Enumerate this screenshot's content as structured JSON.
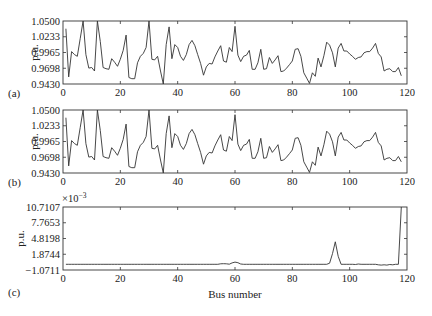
{
  "chart_data": [
    {
      "type": "line",
      "panel_label": "(a)",
      "ylabel": "p.u.",
      "xlabel": "",
      "xlim": [
        0,
        120
      ],
      "ylim": [
        0.943,
        1.05
      ],
      "xticks": [
        "0",
        "20",
        "40",
        "60",
        "80",
        "100",
        "120"
      ],
      "yticks": [
        "1.0500",
        "1.0233",
        "0.9965",
        "0.9698",
        "0.9430"
      ],
      "grid": false,
      "x": [
        1,
        2,
        3,
        4,
        5,
        6,
        7,
        8,
        9,
        10,
        11,
        12,
        13,
        14,
        15,
        16,
        17,
        18,
        19,
        20,
        21,
        22,
        23,
        24,
        25,
        26,
        27,
        28,
        29,
        30,
        31,
        32,
        33,
        34,
        35,
        36,
        37,
        38,
        39,
        40,
        41,
        42,
        43,
        44,
        45,
        46,
        47,
        48,
        49,
        50,
        51,
        52,
        53,
        54,
        55,
        56,
        57,
        58,
        59,
        60,
        61,
        62,
        63,
        64,
        65,
        66,
        67,
        68,
        69,
        70,
        71,
        72,
        73,
        74,
        75,
        76,
        77,
        78,
        79,
        80,
        81,
        82,
        83,
        84,
        85,
        86,
        87,
        88,
        89,
        90,
        91,
        92,
        93,
        94,
        95,
        96,
        97,
        98,
        99,
        100,
        101,
        102,
        103,
        104,
        105,
        106,
        107,
        108,
        109,
        110,
        111,
        112,
        113,
        114,
        115,
        116,
        117,
        118
      ],
      "series": [
        {
          "name": "Voltage magnitude (a)",
          "values": [
            1.037,
            0.955,
            0.998,
            0.993,
            0.99,
            1.02,
            1.05,
            0.993,
            0.97,
            0.971,
            0.965,
            1.05,
            1.015,
            0.971,
            0.969,
            0.968,
            0.986,
            0.98,
            0.973,
            0.985,
            1.0,
            1.026,
            0.954,
            0.952,
            0.952,
            0.979,
            0.99,
            0.995,
            1.005,
            1.05,
            0.985,
            0.984,
            0.99,
            0.965,
            0.943,
            1.01,
            1.04,
            0.986,
            1.01,
            1.005,
            0.99,
            0.983,
            0.993,
            1.01,
            1.017,
            1.008,
            0.993,
            0.978,
            0.958,
            0.972,
            0.978,
            0.977,
            0.989,
            0.999,
            1.008,
            0.982,
            0.98,
            1.005,
            0.998,
            1.041,
            0.992,
            0.981,
            0.99,
            0.992,
            1.0,
            0.968,
            0.968,
            0.979,
            1.002,
            0.968,
            0.969,
            0.988,
            0.978,
            0.984,
            0.991,
            0.964,
            0.965,
            0.97,
            0.976,
            0.982,
            1.002,
            1.003,
            0.99,
            0.962,
            0.953,
            0.944,
            0.962,
            0.956,
            0.987,
            0.972,
            0.991,
            1.014,
            1.009,
            0.996,
            0.972,
            1.004,
            1.012,
            0.999,
            0.999,
            0.994,
            0.99,
            0.985,
            0.988,
            0.989,
            0.996,
            0.998,
            0.998,
            1.004,
            1.012,
            0.995,
            0.989,
            0.965,
            0.968,
            0.969,
            0.964,
            0.964,
            0.971,
            0.957
          ]
        }
      ]
    },
    {
      "type": "line",
      "panel_label": "(b)",
      "ylabel": "p.u.",
      "xlabel": "",
      "xlim": [
        0,
        120
      ],
      "ylim": [
        0.943,
        1.05
      ],
      "xticks": [
        "0",
        "20",
        "40",
        "60",
        "80",
        "100",
        "120"
      ],
      "yticks": [
        "1.0500",
        "1.0233",
        "0.9965",
        "0.9698",
        "0.9430"
      ],
      "grid": false,
      "x": [
        1,
        2,
        3,
        4,
        5,
        6,
        7,
        8,
        9,
        10,
        11,
        12,
        13,
        14,
        15,
        16,
        17,
        18,
        19,
        20,
        21,
        22,
        23,
        24,
        25,
        26,
        27,
        28,
        29,
        30,
        31,
        32,
        33,
        34,
        35,
        36,
        37,
        38,
        39,
        40,
        41,
        42,
        43,
        44,
        45,
        46,
        47,
        48,
        49,
        50,
        51,
        52,
        53,
        54,
        55,
        56,
        57,
        58,
        59,
        60,
        61,
        62,
        63,
        64,
        65,
        66,
        67,
        68,
        69,
        70,
        71,
        72,
        73,
        74,
        75,
        76,
        77,
        78,
        79,
        80,
        81,
        82,
        83,
        84,
        85,
        86,
        87,
        88,
        89,
        90,
        91,
        92,
        93,
        94,
        95,
        96,
        97,
        98,
        99,
        100,
        101,
        102,
        103,
        104,
        105,
        106,
        107,
        108,
        109,
        110,
        111,
        112,
        113,
        114,
        115,
        116,
        117,
        118
      ],
      "series": [
        {
          "name": "Voltage magnitude (b)",
          "values": [
            1.037,
            0.955,
            0.998,
            0.993,
            0.99,
            1.02,
            1.05,
            0.993,
            0.97,
            0.971,
            0.965,
            1.05,
            1.015,
            0.971,
            0.969,
            0.968,
            0.986,
            0.98,
            0.973,
            0.985,
            1.0,
            1.026,
            0.954,
            0.952,
            0.952,
            0.979,
            0.99,
            0.995,
            1.005,
            1.05,
            0.985,
            0.984,
            0.99,
            0.965,
            0.943,
            1.01,
            1.04,
            0.986,
            1.01,
            1.005,
            0.99,
            0.983,
            0.993,
            1.01,
            1.017,
            1.008,
            0.993,
            0.978,
            0.958,
            0.972,
            0.978,
            0.977,
            0.989,
            0.999,
            1.008,
            0.982,
            0.98,
            1.005,
            0.998,
            1.042,
            0.992,
            0.981,
            0.99,
            0.992,
            1.0,
            0.968,
            0.968,
            0.979,
            1.002,
            0.968,
            0.969,
            0.988,
            0.978,
            0.984,
            0.991,
            0.964,
            0.965,
            0.97,
            0.976,
            0.982,
            1.002,
            1.003,
            0.99,
            0.962,
            0.953,
            0.944,
            0.962,
            0.956,
            0.987,
            0.972,
            0.991,
            1.014,
            1.009,
            0.996,
            0.972,
            1.004,
            1.012,
            0.999,
            0.999,
            0.994,
            0.99,
            0.985,
            0.988,
            0.989,
            0.996,
            0.998,
            0.998,
            1.004,
            1.012,
            0.995,
            0.989,
            0.965,
            0.968,
            0.969,
            0.964,
            0.964,
            0.971,
            0.962
          ]
        }
      ]
    },
    {
      "type": "line",
      "panel_label": "(c)",
      "ylabel": "p.u.",
      "xlabel": "Bus number",
      "scale_label": "×10⁻³",
      "xlim": [
        0,
        120
      ],
      "ylim": [
        -1.0711,
        10.7107
      ],
      "xticks": [
        "0",
        "20",
        "40",
        "60",
        "80",
        "100",
        "120"
      ],
      "yticks": [
        "10.7107",
        "7.7653",
        "4.8198",
        "1.8744",
        "−1.0711"
      ],
      "grid": false,
      "x": [
        1,
        2,
        3,
        4,
        5,
        6,
        7,
        8,
        9,
        10,
        11,
        12,
        13,
        14,
        15,
        16,
        17,
        18,
        19,
        20,
        21,
        22,
        23,
        24,
        25,
        26,
        27,
        28,
        29,
        30,
        31,
        32,
        33,
        34,
        35,
        36,
        37,
        38,
        39,
        40,
        41,
        42,
        43,
        44,
        45,
        46,
        47,
        48,
        49,
        50,
        51,
        52,
        53,
        54,
        55,
        56,
        57,
        58,
        59,
        60,
        61,
        62,
        63,
        64,
        65,
        66,
        67,
        68,
        69,
        70,
        71,
        72,
        73,
        74,
        75,
        76,
        77,
        78,
        79,
        80,
        81,
        82,
        83,
        84,
        85,
        86,
        87,
        88,
        89,
        90,
        91,
        92,
        93,
        94,
        95,
        96,
        97,
        98,
        99,
        100,
        101,
        102,
        103,
        104,
        105,
        106,
        107,
        108,
        109,
        110,
        111,
        112,
        113,
        114,
        115,
        116,
        117,
        118
      ],
      "series": [
        {
          "name": "Difference (a)−(b)",
          "values": [
            0,
            0,
            0,
            0,
            0,
            0,
            0,
            0,
            0,
            0,
            0,
            0,
            0,
            0,
            0,
            0,
            0,
            0,
            0,
            0,
            0,
            0,
            0,
            0,
            0,
            0,
            0,
            0,
            0,
            0,
            0,
            0,
            0,
            0,
            0,
            0,
            0,
            0,
            0,
            0,
            0,
            0,
            0,
            0,
            0,
            0,
            0,
            0,
            0,
            0,
            0,
            0,
            0,
            0,
            0.08,
            0.1,
            0.08,
            0.02,
            0.25,
            0.4,
            0.3,
            0.05,
            0,
            0,
            0,
            0,
            0,
            0,
            0,
            0,
            0,
            0,
            0,
            0,
            0,
            0,
            0,
            0,
            0,
            0,
            0,
            0,
            0,
            0,
            0,
            0,
            0,
            0,
            0,
            0,
            0,
            0,
            0.2,
            2.0,
            4.2,
            1.5,
            0,
            0,
            0,
            0,
            0,
            -0.05,
            0.05,
            0,
            0,
            0,
            0,
            0,
            0,
            -0.1,
            -0.15,
            -0.1,
            -0.15,
            -0.05,
            -0.1,
            0,
            0,
            10.7107
          ]
        }
      ]
    }
  ],
  "figure": {
    "panels": [
      {
        "label": "(a)",
        "ylabel": "p.u.",
        "yticks": [
          "1.0500",
          "1.0233",
          "0.9965",
          "0.9698",
          "0.9430"
        ],
        "xticks": [
          "0",
          "20",
          "40",
          "60",
          "80",
          "100",
          "120"
        ]
      },
      {
        "label": "(b)",
        "ylabel": "p.u.",
        "yticks": [
          "1.0500",
          "1.0233",
          "0.9965",
          "0.9698",
          "0.9430"
        ],
        "xticks": [
          "0",
          "20",
          "40",
          "60",
          "80",
          "100",
          "120"
        ]
      },
      {
        "label": "(c)",
        "ylabel": "p.u.",
        "scale": "×10",
        "scale_exp": "−3",
        "yticks": [
          "10.7107",
          "7.7653",
          "4.8198",
          "1.8744",
          "−1.0711"
        ],
        "xticks": [
          "0",
          "20",
          "40",
          "60",
          "80",
          "100",
          "120"
        ],
        "xlabel": "Bus number"
      }
    ]
  }
}
